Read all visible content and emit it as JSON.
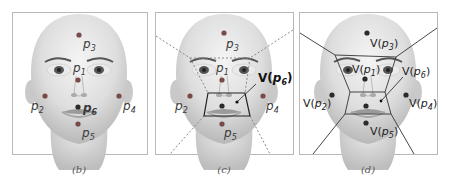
{
  "figure": {
    "panels": [
      {
        "id": "b",
        "caption": "(b)",
        "style": "points",
        "points": [
          {
            "name": "p",
            "sub": "1"
          },
          {
            "name": "p",
            "sub": "2"
          },
          {
            "name": "p",
            "sub": "3"
          },
          {
            "name": "p",
            "sub": "4"
          },
          {
            "name": "p",
            "sub": "5"
          },
          {
            "name": "p",
            "sub": "6",
            "emphasized": true
          }
        ]
      },
      {
        "id": "c",
        "caption": "(c)",
        "style": "dashed-partition",
        "points": [
          {
            "name": "p",
            "sub": "1"
          },
          {
            "name": "p",
            "sub": "2"
          },
          {
            "name": "p",
            "sub": "3"
          },
          {
            "name": "p",
            "sub": "4"
          },
          {
            "name": "p",
            "sub": "5"
          }
        ],
        "region_label": {
          "prefix": "V(",
          "name": "p",
          "sub": "6",
          "suffix": ")"
        }
      },
      {
        "id": "d",
        "caption": "(d)",
        "style": "voronoi",
        "regions": [
          {
            "prefix": "V(",
            "name": "p",
            "sub": "1",
            "suffix": ")"
          },
          {
            "prefix": "V(",
            "name": "p",
            "sub": "2",
            "suffix": ")"
          },
          {
            "prefix": "V(",
            "name": "p",
            "sub": "3",
            "suffix": ")"
          },
          {
            "prefix": "V(",
            "name": "p",
            "sub": "4",
            "suffix": ")"
          },
          {
            "prefix": "V(",
            "name": "p",
            "sub": "5",
            "suffix": ")"
          },
          {
            "prefix": "V(",
            "name": "p",
            "sub": "6",
            "suffix": ")"
          }
        ]
      }
    ],
    "colors": {
      "point": "#7a4a4a",
      "point_dark": "#2a2a2a",
      "frame": "#b9b9b9",
      "dashed_line": "#8a8a8a",
      "solid_line": "#333333"
    }
  }
}
